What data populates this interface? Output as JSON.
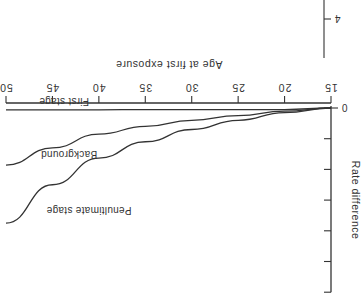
{
  "chart_data": {
    "type": "line",
    "title": "",
    "xlabel": "Age at first exposure",
    "ylabel": "Rate difference",
    "x_ticks": [
      15,
      20,
      25,
      30,
      35,
      40,
      45,
      50
    ],
    "y_tick_labels": [
      "0"
    ],
    "y_tick_count": 7,
    "xlim": [
      15,
      50
    ],
    "ylim": [
      0,
      6
    ],
    "grid": false,
    "orientation_note": "figure rendered rotated 180 degrees",
    "stray_label": "4",
    "x": [
      15,
      20,
      25,
      30,
      35,
      40,
      45,
      50
    ],
    "series": [
      {
        "name": "First stage",
        "values": [
          0.0,
          0.05,
          0.05,
          0.05,
          0.05,
          0.06,
          0.06,
          0.06
        ]
      },
      {
        "name": "Background",
        "values": [
          0.0,
          0.1,
          0.25,
          0.4,
          0.6,
          0.85,
          1.3,
          1.86
        ]
      },
      {
        "name": "Penultimate stage",
        "values": [
          0.0,
          0.15,
          0.4,
          0.7,
          1.1,
          1.63,
          2.5,
          3.75
        ]
      }
    ]
  }
}
